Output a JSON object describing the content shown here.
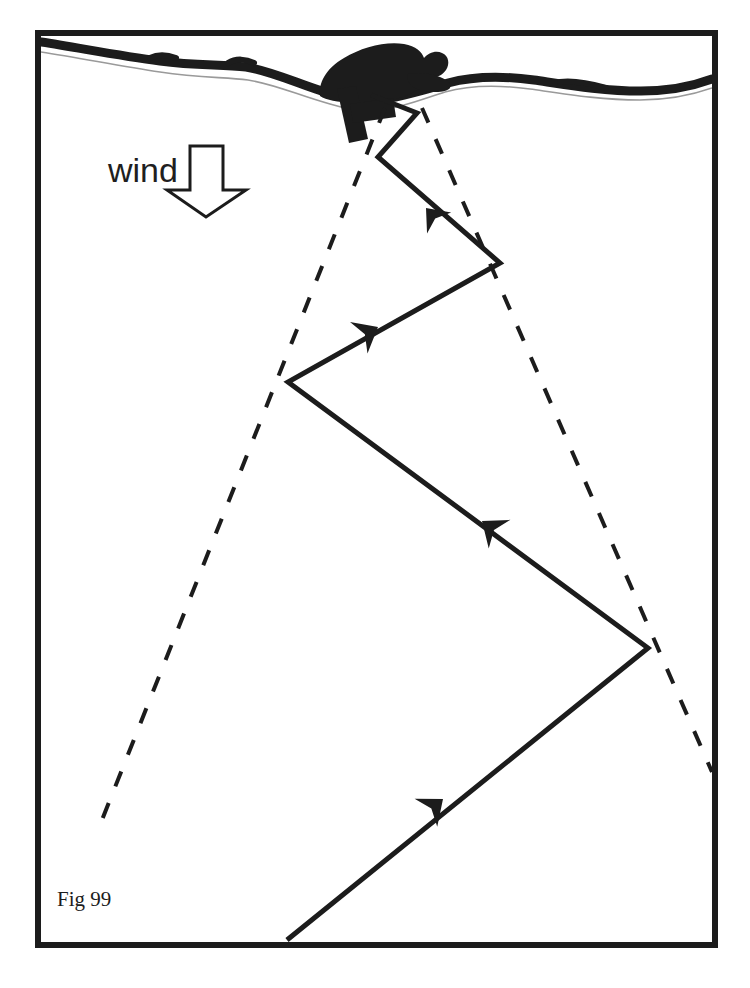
{
  "page": {
    "running_head": "SAILING IN A FORCE FIVE BREEZE",
    "background_color": "#ffffff",
    "ink_color": "#1c1c1c",
    "width": 750,
    "height": 988
  },
  "figure": {
    "caption": "Fig 99",
    "caption_position": {
      "x": 57,
      "y": 906
    },
    "frame": {
      "x": 35,
      "y": 30,
      "width": 683,
      "height": 918,
      "stroke_width": 6,
      "color": "#1c1c1c"
    },
    "wind_label": {
      "text": "wind",
      "x": 108,
      "y": 182,
      "arrow_direction": "down",
      "arrow_style": "hollow-outline"
    },
    "shoreline": {
      "label": "coastline",
      "description": "wavy thick black shore band with thin white water line beneath",
      "band_color": "#1c1c1c"
    },
    "headland": {
      "label": "headland",
      "description": "solid black promontory / hill silhouette on the shore",
      "color": "#1c1c1c"
    },
    "jetty": {
      "label": "jetty",
      "description": "thick black L-shaped pier projecting from the headland",
      "color": "#1c1c1c"
    }
  },
  "chart_data": {
    "type": "diagram",
    "subtitle": "Fig 99",
    "xlabel": "",
    "ylabel": "",
    "xlim": [
      35,
      718
    ],
    "ylim": [
      30,
      948
    ],
    "grid": false,
    "legend": null,
    "annotations": [
      {
        "text": "wind",
        "x": 108,
        "y": 182,
        "type": "label"
      },
      {
        "text": "Fig 99",
        "x": 57,
        "y": 906,
        "type": "caption"
      }
    ],
    "series": [
      {
        "name": "tacking-course",
        "style": "solid",
        "stroke_width": 5,
        "color": "#1c1c1c",
        "direction": "upwind (arrowheads point toward the jetty)",
        "points": [
          [
            287,
            940
          ],
          [
            648,
            648
          ],
          [
            288,
            382
          ],
          [
            500,
            263
          ],
          [
            378,
            157
          ],
          [
            417,
            113
          ],
          [
            371,
            95
          ]
        ]
      },
      {
        "name": "layline-port",
        "style": "dashed",
        "stroke_width": 4,
        "dash": "16 18",
        "color": "#1c1c1c",
        "points": [
          [
            385,
            108
          ],
          [
            98,
            830
          ]
        ]
      },
      {
        "name": "layline-starboard",
        "style": "dashed",
        "stroke_width": 4,
        "dash": "16 18",
        "color": "#1c1c1c",
        "points": [
          [
            422,
            108
          ],
          [
            712,
            772
          ]
        ]
      },
      {
        "name": "wind-arrow",
        "style": "outline-arrow",
        "stroke_width": 3,
        "color": "#1c1c1c",
        "points": [
          [
            206,
            147
          ],
          [
            206,
            213
          ]
        ]
      }
    ],
    "arrow_markers": [
      {
        "on": "tacking-course",
        "x": 443,
        "y": 799,
        "heading": "up-right"
      },
      {
        "on": "tacking-course",
        "x": 482,
        "y": 521,
        "heading": "up-right"
      },
      {
        "on": "tacking-course",
        "x": 378,
        "y": 327,
        "heading": "up-right"
      },
      {
        "on": "tacking-course",
        "x": 426,
        "y": 208,
        "heading": "up-right"
      }
    ]
  }
}
